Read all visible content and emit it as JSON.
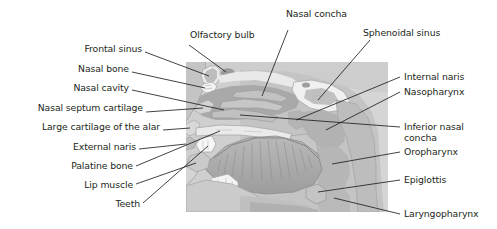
{
  "figure": {
    "type": "anatomical-illustration",
    "panel_color": "#d4d4d4",
    "text_color": "#231f20",
    "leader_color": "#231f20"
  },
  "labels": {
    "olfactory_bulb": "Olfactory bulb",
    "nasal_concha": "Nasal concha",
    "sphenoidal_sinus": "Sphenoidal sinus",
    "frontal_sinus": "Frontal sinus",
    "nasal_bone": "Nasal bone",
    "nasal_cavity": "Nasal cavity",
    "nasal_septum_cartilage": "Nasal septum cartilage",
    "large_cartilage_of_the_alar": "Large cartilage of the alar",
    "external_naris": "External naris",
    "palatine_bone": "Palatine bone",
    "lip_muscle": "Lip muscle",
    "teeth": "Teeth",
    "internal_naris": "Internal naris",
    "nasopharynx": "Nasopharynx",
    "inferior_nasal_concha": "Inferior nasal concha",
    "oropharynx": "Oropharynx",
    "epiglottis": "Epiglottis",
    "laryngopharynx": "Laryngopharynx"
  }
}
